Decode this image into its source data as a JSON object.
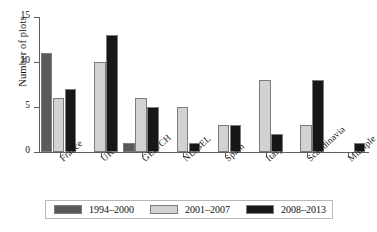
{
  "chart_data": {
    "type": "bar",
    "title": "",
    "xlabel": "",
    "ylabel": "Number of plots",
    "ylim": [
      0,
      15
    ],
    "yticks": [
      0,
      5,
      10,
      15
    ],
    "ytick_labels": [
      "0",
      "5",
      "10",
      "15"
    ],
    "grid": false,
    "legend_position": "bottom",
    "categories": [
      "France",
      "UK",
      "GER/CH",
      "NL/BEL",
      "Spain",
      "Italy",
      "Scandinavia",
      "Multiple"
    ],
    "series": [
      {
        "name": "1994–2000",
        "color": "#5a5a5a",
        "values": [
          11,
          0,
          1,
          0,
          0,
          0,
          0,
          0
        ]
      },
      {
        "name": "2001–2007",
        "color": "#d2d2d2",
        "values": [
          6,
          10,
          6,
          5,
          3,
          8,
          3,
          0
        ]
      },
      {
        "name": "2008–2013",
        "color": "#171717",
        "values": [
          7,
          13,
          5,
          1,
          3,
          2,
          8,
          1
        ]
      }
    ]
  },
  "axis": {
    "line_color": "#5e5e5e"
  }
}
